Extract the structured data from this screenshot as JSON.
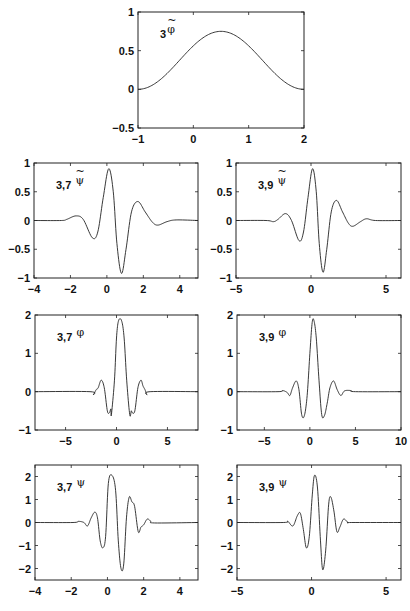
{
  "chart_data": [
    {
      "type": "line",
      "id": "phi3_dual",
      "label": {
        "prefix": "3",
        "symbol": "φ",
        "tilde": true
      },
      "box": [
        138,
        12,
        304,
        128
      ],
      "xlim": [
        -1,
        2
      ],
      "ylim": [
        -0.5,
        1
      ],
      "xticks": [
        -1,
        0,
        1,
        2
      ],
      "yticks": [
        -0.5,
        0,
        0.5,
        1
      ],
      "xtick_labels": [
        "−1",
        "0",
        "1",
        "2"
      ],
      "ytick_labels": [
        "−0.5",
        "0",
        "0.5",
        "1"
      ],
      "grid": false,
      "fn": "bump",
      "params": {
        "center": 0.5,
        "amp": 0.75,
        "support": [
          -1,
          2
        ]
      }
    },
    {
      "type": "line",
      "id": "psi37_dual",
      "label": {
        "prefix": "3,7",
        "symbol": "ψ",
        "tilde": true
      },
      "box": [
        34,
        163,
        198,
        278
      ],
      "xlim": [
        -4,
        5
      ],
      "ylim": [
        -1,
        1
      ],
      "xticks": [
        -4,
        -2,
        0,
        2,
        4
      ],
      "yticks": [
        -1,
        -0.5,
        0,
        0.5,
        1
      ],
      "xtick_labels": [
        "−4",
        "−2",
        "0",
        "2",
        "4"
      ],
      "ytick_labels": [
        "−1",
        "−0.5",
        "0",
        "0.5",
        "1"
      ],
      "grid": false,
      "points": [
        [
          -4,
          0
        ],
        [
          -2.5,
          0
        ],
        [
          -2.2,
          0.02
        ],
        [
          -1.7,
          0.08
        ],
        [
          -1.3,
          0.02
        ],
        [
          -0.8,
          -0.3
        ],
        [
          -0.5,
          -0.2
        ],
        [
          -0.2,
          0.4
        ],
        [
          0.1,
          0.9
        ],
        [
          0.35,
          0.5
        ],
        [
          0.55,
          -0.4
        ],
        [
          0.8,
          -0.92
        ],
        [
          1.05,
          -0.5
        ],
        [
          1.35,
          0.15
        ],
        [
          1.7,
          0.33
        ],
        [
          2.1,
          0.15
        ],
        [
          2.5,
          -0.03
        ],
        [
          2.8,
          -0.08
        ],
        [
          3.3,
          -0.02
        ],
        [
          3.8,
          0.01
        ],
        [
          5,
          0
        ]
      ]
    },
    {
      "type": "line",
      "id": "psi39_dual",
      "label": {
        "prefix": "3,9",
        "symbol": "ψ",
        "tilde": true
      },
      "box": [
        236,
        163,
        401,
        278
      ],
      "xlim": [
        -5,
        6
      ],
      "ylim": [
        -1,
        1
      ],
      "xticks": [
        -5,
        0,
        5
      ],
      "yticks": [
        -1,
        -0.5,
        0,
        0.5,
        1
      ],
      "xtick_labels": [
        "−5",
        "0",
        "5"
      ],
      "ytick_labels": [
        "−1",
        "−0.5",
        "0",
        "0.5",
        "1"
      ],
      "grid": false,
      "points": [
        [
          -5,
          0
        ],
        [
          -3,
          0
        ],
        [
          -2.5,
          -0.02
        ],
        [
          -2.2,
          0.02
        ],
        [
          -1.7,
          0.12
        ],
        [
          -1.3,
          0.0
        ],
        [
          -0.8,
          -0.35
        ],
        [
          -0.5,
          -0.2
        ],
        [
          -0.2,
          0.4
        ],
        [
          0.1,
          0.9
        ],
        [
          0.35,
          0.5
        ],
        [
          0.55,
          -0.4
        ],
        [
          0.8,
          -0.9
        ],
        [
          1.05,
          -0.5
        ],
        [
          1.35,
          0.15
        ],
        [
          1.7,
          0.35
        ],
        [
          2.1,
          0.15
        ],
        [
          2.5,
          -0.05
        ],
        [
          2.8,
          -0.1
        ],
        [
          3.3,
          -0.02
        ],
        [
          3.7,
          0.03
        ],
        [
          4.3,
          0.0
        ],
        [
          6,
          0
        ]
      ]
    },
    {
      "type": "line",
      "id": "phi37",
      "label": {
        "prefix": "3,7",
        "symbol": "φ",
        "tilde": false
      },
      "box": [
        35,
        315,
        198,
        430
      ],
      "xlim": [
        -8,
        8
      ],
      "ylim": [
        -1,
        2
      ],
      "xticks": [
        -5,
        0,
        5
      ],
      "yticks": [
        -1,
        0,
        1,
        2
      ],
      "xtick_labels": [
        "−5",
        "0",
        "5"
      ],
      "ytick_labels": [
        "−1",
        "0",
        "1",
        "2"
      ],
      "grid": false,
      "points": [
        [
          -8,
          0
        ],
        [
          -2.6,
          0
        ],
        [
          -2.3,
          -0.08
        ],
        [
          -2.0,
          0.05
        ],
        [
          -1.8,
          0.1
        ],
        [
          -1.5,
          0.3
        ],
        [
          -1.2,
          0.1
        ],
        [
          -0.9,
          -0.5
        ],
        [
          -0.7,
          -0.55
        ],
        [
          -0.55,
          -0.45
        ],
        [
          -0.5,
          -0.6
        ],
        [
          -0.2,
          0.3
        ],
        [
          0.0,
          1.4
        ],
        [
          0.2,
          1.85
        ],
        [
          0.5,
          1.85
        ],
        [
          0.75,
          1.4
        ],
        [
          1.0,
          0.3
        ],
        [
          1.3,
          -0.6
        ],
        [
          1.45,
          -0.5
        ],
        [
          1.55,
          -0.55
        ],
        [
          1.8,
          -0.5
        ],
        [
          2.1,
          0.1
        ],
        [
          2.4,
          0.3
        ],
        [
          2.6,
          0.15
        ],
        [
          2.8,
          0.05
        ],
        [
          3.0,
          -0.08
        ],
        [
          3.3,
          0.0
        ],
        [
          8,
          0
        ]
      ]
    },
    {
      "type": "line",
      "id": "phi39",
      "label": {
        "prefix": "3,9",
        "symbol": "φ",
        "tilde": false
      },
      "box": [
        237,
        315,
        401,
        430
      ],
      "xlim": [
        -8,
        10
      ],
      "ylim": [
        -1,
        2
      ],
      "xticks": [
        -5,
        0,
        5,
        10
      ],
      "yticks": [
        -1,
        0,
        1,
        2
      ],
      "xtick_labels": [
        "−5",
        "0",
        "5",
        "10"
      ],
      "ytick_labels": [
        "−1",
        "0",
        "1",
        "2"
      ],
      "grid": false,
      "points": [
        [
          -8,
          0
        ],
        [
          -3.5,
          0
        ],
        [
          -3.0,
          0.03
        ],
        [
          -2.5,
          -0.02
        ],
        [
          -2.2,
          -0.1
        ],
        [
          -1.9,
          0.1
        ],
        [
          -1.5,
          0.28
        ],
        [
          -1.2,
          0.05
        ],
        [
          -0.9,
          -0.6
        ],
        [
          -0.6,
          -0.62
        ],
        [
          -0.3,
          -0.1
        ],
        [
          0.0,
          1.0
        ],
        [
          0.25,
          1.8
        ],
        [
          0.45,
          1.85
        ],
        [
          0.7,
          1.4
        ],
        [
          1.0,
          0.3
        ],
        [
          1.3,
          -0.6
        ],
        [
          1.6,
          -0.62
        ],
        [
          1.9,
          -0.3
        ],
        [
          2.2,
          0.1
        ],
        [
          2.6,
          0.28
        ],
        [
          3.0,
          0.05
        ],
        [
          3.4,
          -0.1
        ],
        [
          3.8,
          0.02
        ],
        [
          4.5,
          0.03
        ],
        [
          5,
          0
        ],
        [
          10,
          0
        ]
      ]
    },
    {
      "type": "line",
      "id": "psi37",
      "label": {
        "prefix": "3,7",
        "symbol": "ψ",
        "tilde": false
      },
      "box": [
        35,
        465,
        198,
        580
      ],
      "xlim": [
        -4,
        5
      ],
      "ylim": [
        -2.5,
        2.5
      ],
      "xticks": [
        -4,
        -2,
        0,
        2,
        4
      ],
      "yticks": [
        -2,
        -1,
        0,
        1,
        2
      ],
      "xtick_labels": [
        "−4",
        "−2",
        "0",
        "2",
        "4"
      ],
      "ytick_labels": [
        "−2",
        "−1",
        "0",
        "1",
        "2"
      ],
      "grid": false,
      "points": [
        [
          -4,
          0
        ],
        [
          -1.9,
          0
        ],
        [
          -1.6,
          0.05
        ],
        [
          -1.3,
          0.0
        ],
        [
          -1.1,
          -0.15
        ],
        [
          -0.9,
          0.2
        ],
        [
          -0.7,
          0.45
        ],
        [
          -0.55,
          0.2
        ],
        [
          -0.4,
          -0.8
        ],
        [
          -0.25,
          -1.1
        ],
        [
          -0.1,
          -0.6
        ],
        [
          0.05,
          1.7
        ],
        [
          0.25,
          2.05
        ],
        [
          0.45,
          1.4
        ],
        [
          0.6,
          -0.8
        ],
        [
          0.75,
          -2.0
        ],
        [
          0.9,
          -1.8
        ],
        [
          1.05,
          0.2
        ],
        [
          1.2,
          1.1
        ],
        [
          1.35,
          0.9
        ],
        [
          1.5,
          0.7
        ],
        [
          1.7,
          -0.4
        ],
        [
          1.85,
          -0.2
        ],
        [
          2.0,
          -0.1
        ],
        [
          2.2,
          0.15
        ],
        [
          2.4,
          0.05
        ],
        [
          2.6,
          -0.02
        ],
        [
          5,
          0
        ]
      ]
    },
    {
      "type": "line",
      "id": "psi39",
      "label": {
        "prefix": "3,9",
        "symbol": "ψ",
        "tilde": false
      },
      "box": [
        237,
        465,
        401,
        580
      ],
      "xlim": [
        -5,
        6
      ],
      "ylim": [
        -2.5,
        2.5
      ],
      "xticks": [
        -5,
        0,
        5
      ],
      "yticks": [
        -2,
        -1,
        0,
        1,
        2
      ],
      "xtick_labels": [
        "−5",
        "0",
        "5"
      ],
      "ytick_labels": [
        "−2",
        "−1",
        "0",
        "1",
        "2"
      ],
      "grid": false,
      "points": [
        [
          -5,
          0
        ],
        [
          -1.9,
          0
        ],
        [
          -1.6,
          0.05
        ],
        [
          -1.25,
          -0.15
        ],
        [
          -0.95,
          0.3
        ],
        [
          -0.75,
          0.4
        ],
        [
          -0.55,
          -0.3
        ],
        [
          -0.35,
          -1.1
        ],
        [
          -0.15,
          -0.6
        ],
        [
          0.05,
          1.2
        ],
        [
          0.2,
          2.05
        ],
        [
          0.4,
          1.5
        ],
        [
          0.6,
          -0.8
        ],
        [
          0.75,
          -2.05
        ],
        [
          0.95,
          -1.2
        ],
        [
          1.15,
          0.8
        ],
        [
          1.3,
          1.1
        ],
        [
          1.5,
          0.5
        ],
        [
          1.7,
          -0.4
        ],
        [
          1.9,
          -0.2
        ],
        [
          2.15,
          0.15
        ],
        [
          2.45,
          0.0
        ],
        [
          2.7,
          0.0
        ],
        [
          6,
          0
        ]
      ]
    }
  ]
}
